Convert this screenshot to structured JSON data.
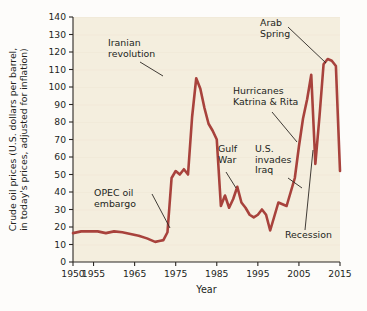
{
  "chart_data": {
    "type": "line",
    "title": "",
    "xlabel": "Year",
    "ylabel": "Crude oil prices (U.S. dollars per barrel, in today's prices, adjusted for inflation)",
    "ylabel_line1": "Crude oil prices (U.S. dollars per barrel,",
    "ylabel_line2": "in today's prices, adjusted for inflation)",
    "xlim": [
      1950,
      2015
    ],
    "ylim": [
      0,
      140
    ],
    "grid": false,
    "legend": "none",
    "line_color": "#a8423c",
    "plot_background": "#f4eede",
    "xticks": [
      1950,
      1955,
      1965,
      1975,
      1985,
      1995,
      2005,
      2015
    ],
    "xtick_labels": [
      "1950",
      "1955",
      "1965",
      "1975",
      "1985",
      "1995",
      "2005",
      "2015"
    ],
    "yticks": [
      0,
      10,
      20,
      30,
      40,
      50,
      60,
      70,
      80,
      90,
      100,
      110,
      120,
      130,
      140
    ],
    "ytick_labels": [
      "0",
      "10",
      "20",
      "30",
      "40",
      "50",
      "60",
      "70",
      "80",
      "90",
      "100",
      "110",
      "120",
      "130",
      "140"
    ],
    "series": [
      {
        "name": "Crude oil price (real, per barrel)",
        "x": [
          1950,
          1952,
          1954,
          1956,
          1958,
          1960,
          1962,
          1964,
          1966,
          1968,
          1970,
          1971,
          1972,
          1973,
          1974,
          1975,
          1976,
          1977,
          1978,
          1979,
          1980,
          1981,
          1982,
          1983,
          1984,
          1985,
          1986,
          1987,
          1988,
          1989,
          1990,
          1991,
          1992,
          1993,
          1994,
          1995,
          1996,
          1997,
          1998,
          1999,
          2000,
          2001,
          2002,
          2003,
          2004,
          2005,
          2006,
          2007,
          2008,
          2009,
          2010,
          2011,
          2012,
          2013,
          2014,
          2015
        ],
        "y": [
          16.5,
          17.5,
          17.5,
          17.5,
          16.5,
          17.5,
          17.0,
          16.0,
          15.0,
          13.5,
          11.5,
          12.0,
          12.5,
          17.0,
          48.0,
          52.0,
          50.0,
          53.0,
          50.0,
          83.0,
          105.0,
          99.0,
          88.0,
          79.0,
          75.0,
          70.0,
          32.0,
          38.0,
          31.0,
          36.0,
          43.0,
          34.0,
          31.0,
          27.0,
          25.5,
          27.0,
          30.0,
          27.0,
          18.0,
          26.0,
          34.0,
          33.0,
          32.0,
          40.0,
          48.0,
          66.0,
          82.0,
          93.0,
          107.0,
          56.0,
          83.0,
          113.0,
          116.0,
          115.0,
          112.0,
          52.0
        ],
        "color": "#a8423c"
      }
    ],
    "annotations": [
      {
        "id": "iranian-revolution",
        "text_lines": [
          "Iranian",
          "revolution"
        ],
        "label_x": 108,
        "label_y": 46,
        "leader": [
          [
            140,
            62
          ],
          [
            163,
            76
          ]
        ]
      },
      {
        "id": "opec-oil-embargo",
        "text_lines": [
          "OPEC oil",
          "embargo"
        ],
        "label_x": 94,
        "label_y": 196,
        "leader": [
          [
            152,
            194
          ],
          [
            170,
            228
          ]
        ]
      },
      {
        "id": "gulf-war",
        "text_lines": [
          "Gulf",
          "War"
        ],
        "label_x": 218,
        "label_y": 152,
        "leader": [
          [
            226,
            172
          ],
          [
            236,
            188
          ]
        ]
      },
      {
        "id": "hurricanes-katrina-rita",
        "text_lines": [
          "Hurricanes",
          "Katrina & Rita"
        ],
        "label_x": 233,
        "label_y": 94,
        "leader": [
          [
            272,
            112
          ],
          [
            297,
            142
          ]
        ]
      },
      {
        "id": "us-invades-iraq",
        "text_lines": [
          "U.S.",
          "invades",
          "Iraq"
        ],
        "label_x": 255,
        "label_y": 152,
        "leader": [
          [
            288,
            178
          ],
          [
            302,
            188
          ]
        ]
      },
      {
        "id": "arab-spring",
        "text_lines": [
          "Arab",
          "Spring"
        ],
        "label_x": 260,
        "label_y": 26,
        "leader": [
          [
            288,
            27
          ],
          [
            326,
            63
          ]
        ]
      },
      {
        "id": "recession",
        "text_lines": [
          "Recession"
        ],
        "label_x": 285,
        "label_y": 238,
        "leader": [
          [
            305,
            230
          ],
          [
            313,
            150
          ]
        ]
      }
    ]
  }
}
